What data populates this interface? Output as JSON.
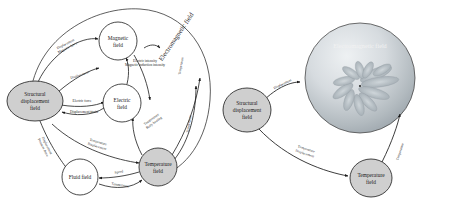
{
  "figure": {
    "panels": [
      {
        "id": "left-panel",
        "name": "detailed-coupling-diagram",
        "nodes": [
          {
            "id": "structural",
            "label_line1": "Structural",
            "label_line2": "displacement",
            "label_line3": "field",
            "shape": "ellipse",
            "fill": "#cfcfcf",
            "cx": 35,
            "cy": 101,
            "rx": 28,
            "ry": 20
          },
          {
            "id": "magnetic",
            "label_line1": "Magnetic",
            "label_line2": "field",
            "label_line3": "",
            "shape": "circle",
            "fill": "#ffffff",
            "cx": 118,
            "cy": 41,
            "rx": 19,
            "ry": 19
          },
          {
            "id": "electric",
            "label_line1": "Electric",
            "label_line2": "field",
            "label_line3": "",
            "shape": "circle",
            "fill": "#ffffff",
            "cx": 122,
            "cy": 103,
            "rx": 19,
            "ry": 19
          },
          {
            "id": "temperature",
            "label_line1": "Temperature",
            "label_line2": "field",
            "label_line3": "",
            "shape": "circle",
            "fill": "#cfcfcf",
            "cx": 158,
            "cy": 167,
            "rx": 19,
            "ry": 19
          },
          {
            "id": "fluid",
            "label_line1": "Fluid field",
            "label_line2": "",
            "label_line3": "",
            "shape": "circle",
            "fill": "#ffffff",
            "cx": 80,
            "cy": 177,
            "rx": 18,
            "ry": 18
          }
        ],
        "region_label": "Electromagnetic field",
        "edge_labels": [
          {
            "id": "e1",
            "line1": "Displacement",
            "line2": "Magnetic force"
          },
          {
            "id": "e2",
            "line1": "Displacement",
            "line2": ""
          },
          {
            "id": "e3",
            "line1": "Electric intensity",
            "line2": "Magnetic induction intensity"
          },
          {
            "id": "e4",
            "line1": "Electric force",
            "line2": ""
          },
          {
            "id": "e5",
            "line1": "Displacement/strain",
            "line2": ""
          },
          {
            "id": "e6",
            "line1": "Displacement",
            "line2": "Pressure force"
          },
          {
            "id": "e7",
            "line1": "Temperature",
            "line2": "Displacement"
          },
          {
            "id": "e8",
            "line1": "Temperature",
            "line2": "Body heating"
          },
          {
            "id": "e9",
            "line1": "Temperature",
            "line2": ""
          },
          {
            "id": "e10",
            "line1": "Temperature",
            "line2": ""
          },
          {
            "id": "e11",
            "line1": "Speed",
            "line2": ""
          },
          {
            "id": "e12",
            "line1": "Temperature",
            "line2": ""
          }
        ]
      },
      {
        "id": "right-panel",
        "name": "simplified-coupling-diagram",
        "sphere_label": "Electromagnetic field",
        "nodes": [
          {
            "id": "structural2",
            "label_line1": "Structural",
            "label_line2": "displacement",
            "label_line3": "field",
            "shape": "ellipse",
            "fill": "#cfcfcf",
            "cx": 247,
            "cy": 110,
            "rx": 24,
            "ry": 22
          },
          {
            "id": "temperature2",
            "label_line1": "Temperature",
            "label_line2": "field",
            "label_line3": "",
            "shape": "circle",
            "fill": "#cfcfcf",
            "cx": 371,
            "cy": 178,
            "rx": 21,
            "ry": 19
          },
          {
            "id": "emsphere",
            "label_line1": "",
            "label_line2": "",
            "label_line3": "",
            "shape": "circle",
            "fill": "#b9bfc4",
            "cx": 360,
            "cy": 78,
            "rx": 55,
            "ry": 55
          }
        ],
        "edge_labels": [
          {
            "id": "r1",
            "line1": "Displacement",
            "line2": ""
          },
          {
            "id": "r2",
            "line1": "Temperature",
            "line2": "Displacement"
          },
          {
            "id": "r3",
            "line1": "Temperature",
            "line2": ""
          }
        ]
      }
    ],
    "colors": {
      "node_gray": "#cfcfcf",
      "node_white": "#ffffff",
      "stroke": "#1a1a1a",
      "sphere_outer": "#9aa3aa",
      "sphere_inner": "#e8ecef",
      "text": "#1a1a1a",
      "sphere_text": "#f2f2f2",
      "background": "#ffffff"
    }
  }
}
